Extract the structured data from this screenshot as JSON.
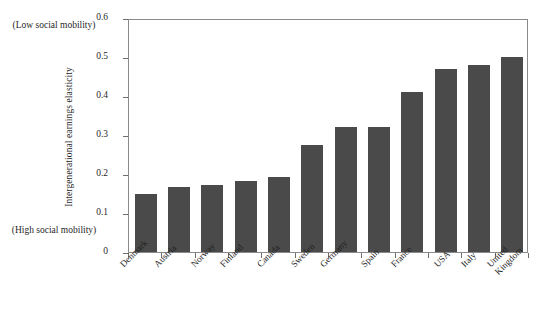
{
  "annotations": {
    "low_mobility": "(Low social\nmobility)",
    "high_mobility": "(High social\nmobility)"
  },
  "chart_data": {
    "type": "bar",
    "title": "",
    "xlabel": "",
    "ylabel": "Intergenerational earnings elasticity",
    "categories": [
      "Denmark",
      "Austria",
      "Norway",
      "Finland",
      "Canada",
      "Sweden",
      "Germany",
      "Spain",
      "France",
      "USA",
      "Italy",
      "United\nKingdom"
    ],
    "values": [
      0.15,
      0.166,
      0.171,
      0.183,
      0.192,
      0.274,
      0.32,
      0.32,
      0.41,
      0.47,
      0.48,
      0.5
    ],
    "ylim": [
      0,
      0.6
    ],
    "ytick_labels": [
      "0",
      "0.1",
      "0.2",
      "0.3",
      "0.4",
      "0.5",
      "0.6"
    ],
    "ytick_values": [
      0,
      0.1,
      0.2,
      0.3,
      0.4,
      0.5,
      0.6
    ],
    "grid": false,
    "legend": null,
    "bar_color": "#4a4a4a",
    "frame_color": "#8a8a8a"
  }
}
